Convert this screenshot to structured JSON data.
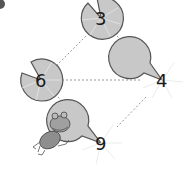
{
  "diagram": {
    "nodes": [
      {
        "id": "top",
        "label": "3",
        "cx": 101,
        "cy": 18
      },
      {
        "id": "left",
        "label": "6",
        "cx": 41,
        "cy": 80
      },
      {
        "id": "right",
        "label": "4",
        "cx": 162,
        "cy": 80
      },
      {
        "id": "bottom",
        "label": "9",
        "cx": 101,
        "cy": 143
      }
    ],
    "edges": [
      [
        "top",
        "left"
      ],
      [
        "top",
        "right"
      ],
      [
        "left",
        "right"
      ],
      [
        "left",
        "bottom"
      ],
      [
        "right",
        "bottom"
      ]
    ],
    "decoration": "frog",
    "colors": {
      "pad_fill": "#c8c8c8",
      "pad_stroke": "#555555",
      "edge": "#9a9a9a",
      "text": "#1a1a1a"
    }
  }
}
